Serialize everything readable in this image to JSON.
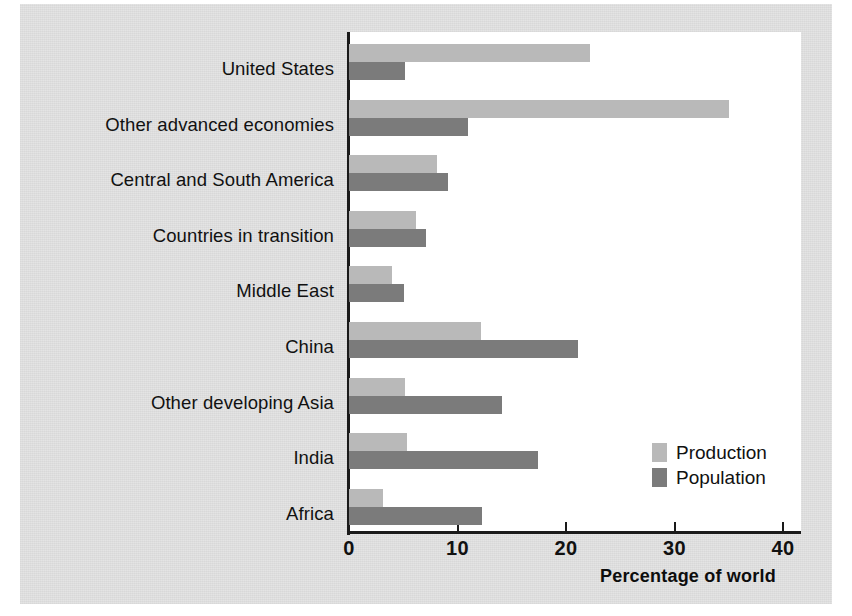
{
  "figure": {
    "background_color": "#e3e3e3",
    "plot_background_color": "#ffffff",
    "axis_color": "#1a1a1a"
  },
  "legend": {
    "position": "inside-lower-right",
    "entries": [
      {
        "label": "Production",
        "color": "#b9b9b9",
        "swatch_name": "production-swatch"
      },
      {
        "label": "Population",
        "color": "#7b7b7b",
        "swatch_name": "population-swatch"
      }
    ]
  },
  "axis": {
    "x_title": "Percentage of world",
    "x_ticks": [
      "0",
      "10",
      "20",
      "30",
      "40"
    ],
    "x_tick_values": [
      0,
      10,
      20,
      30,
      40
    ]
  },
  "chart_data": {
    "type": "bar",
    "orientation": "horizontal",
    "title": "",
    "subtitle": "",
    "xlabel": "Percentage of world",
    "ylabel": "",
    "xlim": [
      0,
      41.6
    ],
    "grid": false,
    "legend_position": "inside lower right",
    "categories": [
      "United States",
      "Other advanced economies",
      "Central and South America",
      "Countries in transition",
      "Middle East",
      "China",
      "Other developing Asia",
      "India",
      "Africa"
    ],
    "series": [
      {
        "name": "Production",
        "color": "#b9b9b9",
        "values": [
          22.2,
          35.0,
          8.1,
          6.2,
          4.0,
          12.2,
          5.2,
          5.3,
          3.1
        ]
      },
      {
        "name": "Population",
        "color": "#7b7b7b",
        "values": [
          5.2,
          11.0,
          9.1,
          7.1,
          5.1,
          21.1,
          14.1,
          17.4,
          12.3
        ]
      }
    ]
  }
}
